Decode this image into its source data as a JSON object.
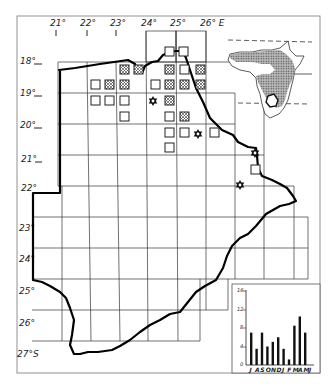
{
  "map": {
    "longitude_labels": [
      "21°",
      "22°",
      "23°",
      "24°",
      "25°",
      "26° E"
    ],
    "latitude_labels": [
      "18°",
      "19°",
      "20°",
      "21°",
      "22°",
      "23°",
      "24°",
      "25°",
      "26°",
      "27°S"
    ],
    "symbols": {
      "open_square": "record-square",
      "hatched_square": "hatched-record-square",
      "star": "star-of-david-record"
    }
  },
  "inset": {
    "description": "Africa distribution inset with shaded range and Botswana outline"
  },
  "chart_data": {
    "type": "bar",
    "title": "",
    "xlabel": "",
    "ylabel": "",
    "categories": [
      "J",
      "A",
      "S",
      "O",
      "N",
      "D",
      "J",
      "F",
      "M",
      "A",
      "M",
      "J"
    ],
    "values": [
      7,
      3.5,
      7,
      4,
      5,
      6,
      3.5,
      1.2,
      8.5,
      10.5,
      7,
      0
    ],
    "yticks": [
      "0",
      "4",
      "8",
      "12",
      "16"
    ],
    "ylim": [
      0,
      16
    ],
    "grid": false
  }
}
